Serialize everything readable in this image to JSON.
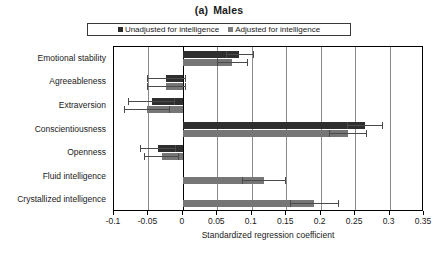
{
  "chart_data": {
    "type": "bar",
    "orientation": "horizontal",
    "title_parts": [
      "(a)",
      "Males"
    ],
    "xlabel": "Standardized regression coefficient",
    "ylabel": "",
    "xlim": [
      -0.1,
      0.35
    ],
    "xticks": [
      -0.1,
      -0.05,
      0,
      0.05,
      0.1,
      0.15,
      0.2,
      0.25,
      0.3,
      0.35
    ],
    "xticklabels": [
      "-0.1",
      "-0.05",
      "0",
      "0.05",
      "0.1",
      "0.15",
      "0.2",
      "0.25",
      "0.3",
      "0.35"
    ],
    "grid": "vertical",
    "legend_position": "top",
    "categories": [
      "Emotional stability",
      "Agreeableness",
      "Extraversion",
      "Conscientiousness",
      "Openness",
      "Fluid intelligence",
      "Crystallized intelligence"
    ],
    "series": [
      {
        "name": "Unadjusted for intelligence",
        "color": "#2e2e2e",
        "values": [
          0.082,
          -0.024,
          -0.045,
          0.264,
          -0.036,
          null,
          null
        ],
        "ci_low": [
          0.062,
          -0.052,
          -0.079,
          0.238,
          -0.062,
          null,
          null
        ],
        "ci_high": [
          0.103,
          0.005,
          -0.012,
          0.291,
          -0.01,
          null,
          null
        ]
      },
      {
        "name": "Adjusted for intelligence",
        "color": "#767676",
        "values": [
          0.071,
          -0.024,
          -0.052,
          0.24,
          -0.031,
          0.118,
          0.19
        ],
        "ci_low": [
          0.049,
          -0.052,
          -0.086,
          0.212,
          -0.057,
          0.086,
          0.155
        ],
        "ci_high": [
          0.094,
          0.005,
          -0.019,
          0.268,
          -0.005,
          0.15,
          0.226
        ]
      }
    ]
  },
  "legend": {
    "items": [
      {
        "label": "Unadjusted for intelligence",
        "swatch": "unadj"
      },
      {
        "label": "Adjusted for intelligence",
        "swatch": "adj"
      }
    ]
  },
  "colors": {
    "unadjusted": "#2e2e2e",
    "adjusted": "#767676",
    "grid": "#8a8a8a",
    "axis": "#000000",
    "background": "#ffffff"
  }
}
